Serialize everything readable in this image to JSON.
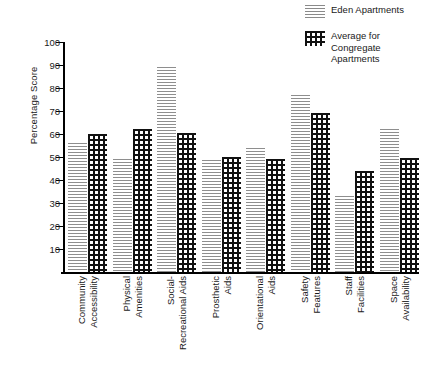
{
  "chart_data": {
    "type": "bar",
    "title": "",
    "xlabel": "",
    "ylabel": "Percentage Score",
    "ylim": [
      0,
      100
    ],
    "yticks": [
      10,
      20,
      30,
      40,
      50,
      60,
      70,
      80,
      90,
      100
    ],
    "grid": false,
    "legend_position": "top-right",
    "categories": [
      "Community Accessibility",
      "Physical Amenities",
      "Social-Recreational Aids",
      "Prosthetic Aids",
      "Orientational Aids",
      "Safety Features",
      "Staff Facilities",
      "Space Availability"
    ],
    "category_lines": [
      [
        "Community",
        "Accessibility"
      ],
      [
        "Physical",
        "Amenities"
      ],
      [
        "Social-",
        "Recreational Aids"
      ],
      [
        "Prosthetic",
        "Aids"
      ],
      [
        "Orientational",
        "Aids"
      ],
      [
        "Safety",
        "Features"
      ],
      [
        "Staff",
        "Facilities"
      ],
      [
        "Space",
        "Availability"
      ]
    ],
    "series": [
      {
        "name": "Eden Apartments",
        "pattern": "horizontal-lines",
        "color": "#8e8e8e",
        "values": [
          56,
          49,
          89,
          48.5,
          54,
          77,
          33,
          62
        ]
      },
      {
        "name": "Average for Congregate Apartments",
        "pattern": "dots",
        "color": "#111111",
        "values": [
          60,
          62,
          60.5,
          50,
          49,
          69,
          44,
          49.5
        ]
      }
    ]
  },
  "legend": {
    "items": [
      {
        "label": "Eden Apartments",
        "swatch": "lines-swatch"
      },
      {
        "label": "Average for\nCongregate\nApartments",
        "swatch": "dots-swatch"
      }
    ]
  },
  "axes": {
    "y_title": "Percentage Score",
    "y_ticks": [
      "100",
      "90",
      "80",
      "70",
      "60",
      "50",
      "40",
      "30",
      "20",
      "10"
    ]
  }
}
